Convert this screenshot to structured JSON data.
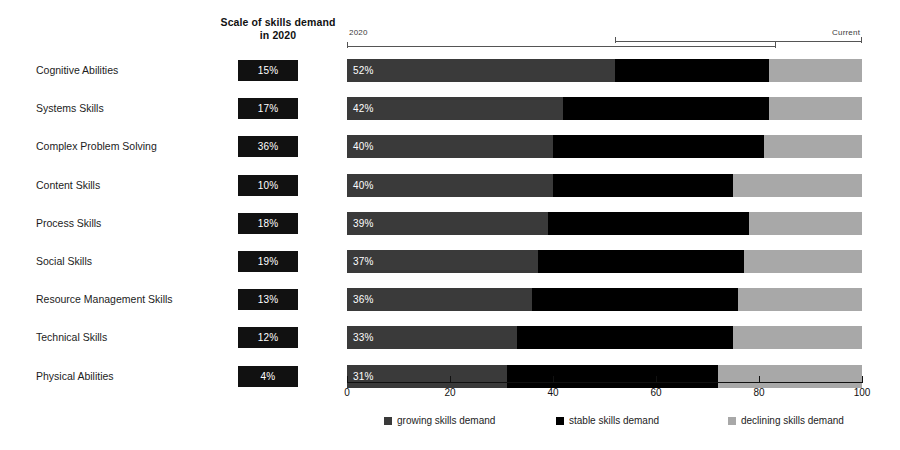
{
  "header": {
    "scale_column_title": "Scale of skills demand in 2020"
  },
  "annotations": {
    "left_label": "2020",
    "right_label": "Current",
    "lower_span": {
      "from": 0,
      "to": 83
    },
    "upper_span": {
      "from": 52,
      "to": 100
    }
  },
  "legend": {
    "position": "bottom",
    "items": [
      {
        "label": "growing skills demand",
        "color": "#3a3a3a",
        "key": "growing"
      },
      {
        "label": "stable skills demand",
        "color": "#000000",
        "key": "stable"
      },
      {
        "label": "declining skills demand",
        "color": "#a8a8a8",
        "key": "declining"
      }
    ]
  },
  "axis": {
    "ticks": [
      0,
      20,
      40,
      60,
      80,
      100
    ],
    "tick_labels": [
      "0",
      "20",
      "40",
      "60",
      "80",
      "100"
    ]
  },
  "chart_data": {
    "type": "bar",
    "title": "",
    "subtitle": "",
    "orientation": "horizontal",
    "stacked": true,
    "stack_total": 100,
    "xlabel": "",
    "ylabel": "",
    "xlim": [
      0,
      100
    ],
    "grid": false,
    "legend_position": "bottom",
    "categories": [
      "Cognitive Abilities",
      "Systems Skills",
      "Complex Problem Solving",
      "Content Skills",
      "Process Skills",
      "Social Skills",
      "Resource Management Skills",
      "Technical Skills",
      "Physical Abilities"
    ],
    "series": [
      {
        "name": "growing skills demand",
        "color": "#3a3a3a",
        "values": [
          52,
          42,
          40,
          40,
          39,
          37,
          36,
          33,
          31
        ]
      },
      {
        "name": "stable skills demand",
        "color": "#000000",
        "values": [
          30,
          40,
          41,
          35,
          39,
          40,
          40,
          42,
          41
        ]
      },
      {
        "name": "declining skills demand",
        "color": "#a8a8a8",
        "values": [
          18,
          18,
          19,
          25,
          22,
          23,
          24,
          25,
          28
        ]
      }
    ],
    "bar_labels": [
      "52%",
      "42%",
      "40%",
      "40%",
      "39%",
      "37%",
      "36%",
      "33%",
      "31%"
    ],
    "scale_of_skills_demand_2020": [
      "15%",
      "17%",
      "36%",
      "10%",
      "18%",
      "19%",
      "13%",
      "12%",
      "4%"
    ]
  },
  "rows": [
    {
      "label": "Cognitive Abilities",
      "scale": "15%",
      "value": "52%",
      "growing": 52,
      "stable": 30,
      "declining": 18
    },
    {
      "label": "Systems Skills",
      "scale": "17%",
      "value": "42%",
      "growing": 42,
      "stable": 40,
      "declining": 18
    },
    {
      "label": "Complex Problem Solving",
      "scale": "36%",
      "value": "40%",
      "growing": 40,
      "stable": 41,
      "declining": 19
    },
    {
      "label": "Content Skills",
      "scale": "10%",
      "value": "40%",
      "growing": 40,
      "stable": 35,
      "declining": 25
    },
    {
      "label": "Process Skills",
      "scale": "18%",
      "value": "39%",
      "growing": 39,
      "stable": 39,
      "declining": 22
    },
    {
      "label": "Social Skills",
      "scale": "19%",
      "value": "37%",
      "growing": 37,
      "stable": 40,
      "declining": 23
    },
    {
      "label": "Resource Management Skills",
      "scale": "13%",
      "value": "36%",
      "growing": 36,
      "stable": 40,
      "declining": 24
    },
    {
      "label": "Technical Skills",
      "scale": "12%",
      "value": "33%",
      "growing": 33,
      "stable": 42,
      "declining": 25
    },
    {
      "label": "Physical Abilities",
      "scale": "4%",
      "value": "31%",
      "growing": 31,
      "stable": 41,
      "declining": 28
    }
  ]
}
